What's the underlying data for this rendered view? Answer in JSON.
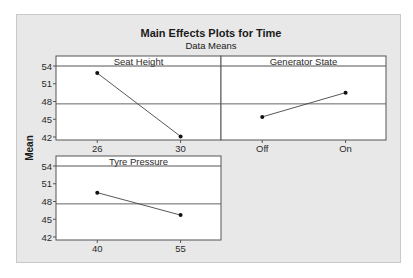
{
  "chart_data": {
    "type": "line",
    "title": "Main Effects Plots for Time",
    "subtitle": "Data Means",
    "ylabel": "Mean",
    "ylim": [
      42,
      54
    ],
    "yticks": [
      42,
      45,
      48,
      51,
      54
    ],
    "grand_mean": 47.6,
    "grid": false,
    "panels": [
      {
        "name": "Seat Height",
        "categories": [
          "26",
          "30"
        ],
        "values": [
          52.8,
          42.1
        ]
      },
      {
        "name": "Generator State",
        "categories": [
          "Off",
          "On"
        ],
        "values": [
          45.4,
          49.5
        ]
      },
      {
        "name": "Tyre Pressure",
        "categories": [
          "40",
          "55"
        ],
        "values": [
          49.5,
          45.7
        ]
      }
    ]
  },
  "colors": {
    "background": "#e8e8e8",
    "plot_area": "#ffffff",
    "frame": "#555555",
    "line": "#444444",
    "marker": "#111111"
  }
}
